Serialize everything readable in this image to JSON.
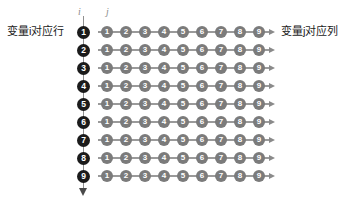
{
  "diagram": {
    "caption_left": "变量i对应行",
    "caption_right": "变量j对应列",
    "axis_letter_i": "i",
    "axis_letter_j": "j",
    "row_indices": [
      "1",
      "2",
      "3",
      "4",
      "5",
      "6",
      "7",
      "8",
      "9"
    ],
    "column_indices": [
      "1",
      "2",
      "3",
      "4",
      "5",
      "6",
      "7",
      "8",
      "9"
    ],
    "colors": {
      "row_token": "#1b1b1b",
      "column_token": "#7b7b7b",
      "axis_line": "#8f8f8f",
      "row_line": "#9a9a9a",
      "caption_text": "#1c1c1c",
      "axis_letter": "#8c8c8c",
      "background": "#ffffff"
    },
    "grid": {
      "rows": 9,
      "columns": 9,
      "row_spacing_px": 18,
      "column_spacing_px": 19,
      "first_row_y_px": 32,
      "first_column_x_px": 107
    }
  }
}
